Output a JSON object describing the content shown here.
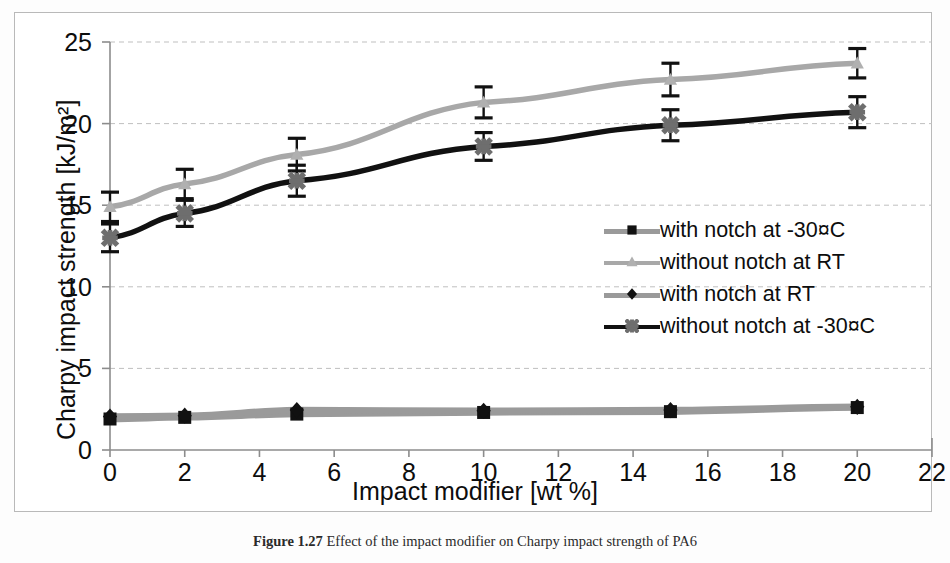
{
  "figure": {
    "caption_prefix": "Figure 1.27",
    "caption_text": "Effect of the impact modifier on Charpy impact strength of PA6",
    "border_color": "#b9b9b9"
  },
  "chart_data": {
    "type": "line",
    "title": "",
    "xlabel": "Impact modifier [wt %]",
    "ylabel": "Charpy impact strength [kJ/m²]",
    "xlim": [
      0,
      22
    ],
    "ylim": [
      0,
      25
    ],
    "xticks": [
      0,
      2,
      4,
      6,
      8,
      10,
      12,
      14,
      16,
      18,
      20,
      22
    ],
    "yticks": [
      0,
      5,
      10,
      15,
      20,
      25
    ],
    "grid": "horizontal-dashed",
    "legend_position": "center-right",
    "x": [
      0,
      2,
      5,
      10,
      15,
      20
    ],
    "series": [
      {
        "name": "with notch at -30¤C",
        "legend_label": "with notch at -30¤C",
        "marker": "square",
        "marker_color": "#111111",
        "line_color": "#9a9a9a",
        "values": [
          1.9,
          2.0,
          2.2,
          2.3,
          2.35,
          2.6
        ],
        "errors": [
          0.15,
          0.15,
          0.15,
          0.15,
          0.15,
          0.15
        ]
      },
      {
        "name": "without notch at RT",
        "legend_label": "without notch at RT",
        "marker": "triangle",
        "marker_color": "#b0b0b0",
        "line_color": "#a8a8a8",
        "values": [
          14.9,
          16.3,
          18.1,
          21.3,
          22.7,
          23.7
        ],
        "errors": [
          0.9,
          0.9,
          1.0,
          0.95,
          1.0,
          0.9
        ]
      },
      {
        "name": "with notch at RT",
        "legend_label": "with notch at RT",
        "marker": "diamond",
        "marker_color": "#111111",
        "line_color": "#9a9a9a",
        "values": [
          2.05,
          2.1,
          2.45,
          2.4,
          2.45,
          2.65
        ],
        "errors": [
          0.15,
          0.15,
          0.15,
          0.15,
          0.15,
          0.15
        ]
      },
      {
        "name": "without notch at -30¤C",
        "legend_label": "without notch at -30¤C",
        "marker": "star",
        "marker_color": "#6e6e6e",
        "line_color": "#111111",
        "values": [
          13.0,
          14.5,
          16.5,
          18.6,
          19.9,
          20.7
        ],
        "errors": [
          0.85,
          0.8,
          0.95,
          0.85,
          0.95,
          0.95
        ]
      }
    ]
  },
  "colors": {
    "grid": "#bfbfbf",
    "axis": "#8c8c8c",
    "text": "#0d0d0d"
  }
}
